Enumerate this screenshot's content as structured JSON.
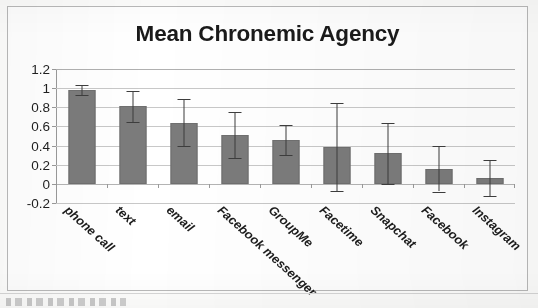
{
  "chart_data": {
    "type": "bar",
    "title": "Mean Chronemic Agency",
    "xlabel": "",
    "ylabel": "",
    "categories": [
      "phone call",
      "text",
      "email",
      "Facebook messenger",
      "GroupMe",
      "Facetime",
      "Snapchat",
      "Facebook",
      "Instagram"
    ],
    "values": [
      0.98,
      0.81,
      0.64,
      0.51,
      0.46,
      0.39,
      0.32,
      0.16,
      0.06
    ],
    "errors": [
      0.05,
      0.16,
      0.25,
      0.24,
      0.16,
      0.46,
      0.32,
      0.24,
      0.19
    ],
    "error_low": [
      0.93,
      0.65,
      0.4,
      0.27,
      0.3,
      -0.07,
      0.0,
      -0.08,
      -0.13
    ],
    "error_high": [
      1.03,
      0.97,
      0.89,
      0.75,
      0.62,
      0.85,
      0.64,
      0.4,
      0.25
    ],
    "ylim": [
      -0.2,
      1.2
    ],
    "yticks": [
      -0.2,
      0,
      0.2,
      0.4,
      0.6,
      0.8,
      1,
      1.2
    ],
    "ytick_labels": [
      "-0.2",
      "0",
      "0.2",
      "0.4",
      "0.6",
      "0.8",
      "1",
      "1.2"
    ],
    "grid": true,
    "legend": false,
    "legend_position": "none",
    "series": [
      {
        "name": "Mean Chronemic Agency",
        "values": [
          0.98,
          0.81,
          0.64,
          0.51,
          0.46,
          0.39,
          0.32,
          0.16,
          0.06
        ]
      }
    ],
    "colors": {
      "bar_fill": "#7b7b7b",
      "bar_stroke": "#6f6f6f",
      "error_bar": "#3d3d3d",
      "gridline": "#c8c8c8",
      "axis": "#9a9a9a",
      "text": "#1c1c1c",
      "frame": "#b9b9b9",
      "background": "#ffffff"
    }
  }
}
